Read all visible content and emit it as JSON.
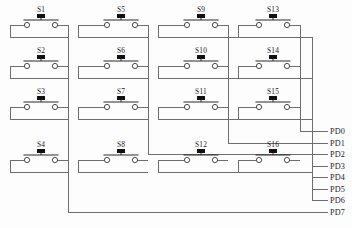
{
  "diagram": {
    "type": "schematic",
    "switch_count": 16,
    "port_count": 8
  },
  "switches": [
    {
      "id": "s1",
      "label": "S1",
      "row": 1,
      "col": 1,
      "cx": 41,
      "cy": 25
    },
    {
      "id": "s2",
      "label": "S2",
      "row": 2,
      "col": 1,
      "cx": 41,
      "cy": 66
    },
    {
      "id": "s3",
      "label": "S3",
      "row": 3,
      "col": 1,
      "cx": 41,
      "cy": 107
    },
    {
      "id": "s4",
      "label": "S4",
      "row": 4,
      "col": 1,
      "cx": 41,
      "cy": 160
    },
    {
      "id": "s5",
      "label": "S5",
      "row": 1,
      "col": 2,
      "cx": 121,
      "cy": 25
    },
    {
      "id": "s6",
      "label": "S6",
      "row": 2,
      "col": 2,
      "cx": 121,
      "cy": 66
    },
    {
      "id": "s7",
      "label": "S7",
      "row": 3,
      "col": 2,
      "cx": 121,
      "cy": 107
    },
    {
      "id": "s8",
      "label": "S8",
      "row": 4,
      "col": 2,
      "cx": 121,
      "cy": 160
    },
    {
      "id": "s9",
      "label": "S9",
      "row": 1,
      "col": 3,
      "cx": 201,
      "cy": 25
    },
    {
      "id": "s10",
      "label": "S10",
      "row": 2,
      "col": 3,
      "cx": 201,
      "cy": 66
    },
    {
      "id": "s11",
      "label": "S11",
      "row": 3,
      "col": 3,
      "cx": 201,
      "cy": 107
    },
    {
      "id": "s12",
      "label": "S12",
      "row": 4,
      "col": 3,
      "cx": 201,
      "cy": 160
    },
    {
      "id": "s13",
      "label": "S13",
      "row": 1,
      "col": 4,
      "cx": 273,
      "cy": 25
    },
    {
      "id": "s14",
      "label": "S14",
      "row": 2,
      "col": 4,
      "cx": 273,
      "cy": 66
    },
    {
      "id": "s15",
      "label": "S15",
      "row": 3,
      "col": 4,
      "cx": 273,
      "cy": 107
    },
    {
      "id": "s16",
      "label": "S16",
      "row": 4,
      "col": 4,
      "cx": 273,
      "cy": 160
    }
  ],
  "ports": [
    {
      "id": "pd0",
      "label": "PD0",
      "y": 131,
      "kind": "column",
      "source_col": 4
    },
    {
      "id": "pd1",
      "label": "PD1",
      "y": 143,
      "kind": "column",
      "source_col": 3
    },
    {
      "id": "pd2",
      "label": "PD2",
      "y": 154,
      "kind": "column",
      "source_col": 2
    },
    {
      "id": "pd3",
      "label": "PD3",
      "y": 166,
      "kind": "row",
      "source_row": 1
    },
    {
      "id": "pd4",
      "label": "PD4",
      "y": 177,
      "kind": "row",
      "source_row": 2
    },
    {
      "id": "pd5",
      "label": "PD5",
      "y": 189,
      "kind": "row",
      "source_row": 3
    },
    {
      "id": "pd6",
      "label": "PD6",
      "y": 200,
      "kind": "row",
      "source_row": 4
    },
    {
      "id": "pd7",
      "label": "PD7",
      "y": 212,
      "kind": "column",
      "source_col": 1
    }
  ],
  "rows": [
    {
      "id": "row1",
      "y": 37,
      "label": "row-bus-1"
    },
    {
      "id": "row2",
      "y": 78,
      "label": "row-bus-2"
    },
    {
      "id": "row3",
      "y": 119,
      "label": "row-bus-3"
    },
    {
      "id": "row4",
      "y": 172,
      "label": "row-bus-4"
    }
  ],
  "columns": [
    {
      "id": "col1",
      "x": 68,
      "label": "col-bus-1"
    },
    {
      "id": "col2",
      "x": 148,
      "label": "col-bus-2"
    },
    {
      "id": "col3",
      "x": 228,
      "label": "col-bus-3"
    },
    {
      "id": "col4",
      "x": 300,
      "label": "col-bus-4"
    }
  ],
  "style": {
    "wire_color": "#6e6e70",
    "ink_color": "#1b1b1d",
    "plunger_color": "#111113",
    "background": "#fdfdfd"
  }
}
